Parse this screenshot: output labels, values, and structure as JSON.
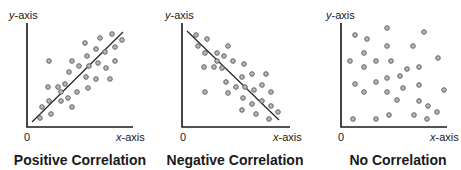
{
  "chart_data": [
    {
      "type": "scatter",
      "title": "Positive Correlation",
      "xlabel": "x-axis",
      "ylabel": "y-axis",
      "origin_label": "0",
      "grid": false,
      "trendline": {
        "present": true,
        "from": [
          5,
          6
        ],
        "to": [
          96,
          95
        ],
        "direction": "positive"
      },
      "axes_px": {
        "origin": [
          27,
          127
        ],
        "x_end": 133,
        "y_top": 22
      },
      "points_px": [
        [
          49,
          61
        ],
        [
          72,
          61
        ],
        [
          85,
          43
        ],
        [
          100,
          38
        ],
        [
          112,
          34
        ],
        [
          122,
          40
        ],
        [
          96,
          49
        ],
        [
          87,
          56
        ],
        [
          105,
          52
        ],
        [
          115,
          47
        ],
        [
          79,
          66
        ],
        [
          69,
          72
        ],
        [
          89,
          66
        ],
        [
          98,
          63
        ],
        [
          106,
          68
        ],
        [
          115,
          61
        ],
        [
          86,
          77
        ],
        [
          96,
          79
        ],
        [
          110,
          79
        ],
        [
          48,
          87
        ],
        [
          58,
          87
        ],
        [
          65,
          84
        ],
        [
          61,
          92
        ],
        [
          49,
          101
        ],
        [
          61,
          101
        ],
        [
          68,
          98
        ],
        [
          77,
          92
        ],
        [
          88,
          88
        ],
        [
          72,
          107
        ],
        [
          42,
          107
        ],
        [
          51,
          114
        ],
        [
          40,
          118
        ]
      ]
    },
    {
      "type": "scatter",
      "title": "Negative Correlation",
      "xlabel": "x-axis",
      "ylabel": "y-axis",
      "origin_label": "0",
      "grid": false,
      "trendline": {
        "present": true,
        "from": [
          5,
          95
        ],
        "to": [
          95,
          7
        ],
        "direction": "negative"
      },
      "axes_px": {
        "origin": [
          182,
          127
        ],
        "x_end": 290,
        "y_top": 22
      },
      "points_px": [
        [
          196,
          35
        ],
        [
          207,
          39
        ],
        [
          198,
          46
        ],
        [
          205,
          53
        ],
        [
          217,
          53
        ],
        [
          228,
          46
        ],
        [
          224,
          56
        ],
        [
          217,
          61
        ],
        [
          233,
          61
        ],
        [
          244,
          64
        ],
        [
          204,
          67
        ],
        [
          214,
          67
        ],
        [
          222,
          68
        ],
        [
          242,
          77
        ],
        [
          252,
          74
        ],
        [
          266,
          74
        ],
        [
          226,
          82
        ],
        [
          236,
          87
        ],
        [
          245,
          87
        ],
        [
          254,
          90
        ],
        [
          262,
          85
        ],
        [
          271,
          92
        ],
        [
          205,
          92
        ],
        [
          228,
          93
        ],
        [
          243,
          98
        ],
        [
          252,
          104
        ],
        [
          262,
          101
        ],
        [
          271,
          106
        ],
        [
          278,
          112
        ],
        [
          242,
          110
        ],
        [
          256,
          114
        ],
        [
          269,
          119
        ]
      ]
    },
    {
      "type": "scatter",
      "title": "No Correlation",
      "xlabel": "x-axis",
      "ylabel": "y-axis",
      "origin_label": "0",
      "grid": false,
      "trendline": {
        "present": false
      },
      "axes_px": {
        "origin": [
          341,
          127
        ],
        "x_end": 447,
        "y_top": 22
      },
      "points_px": [
        [
          355,
          35
        ],
        [
          387,
          28
        ],
        [
          424,
          32
        ],
        [
          367,
          39
        ],
        [
          387,
          46
        ],
        [
          413,
          46
        ],
        [
          364,
          53
        ],
        [
          350,
          61
        ],
        [
          376,
          61
        ],
        [
          391,
          61
        ],
        [
          438,
          58
        ],
        [
          364,
          67
        ],
        [
          407,
          69
        ],
        [
          419,
          67
        ],
        [
          400,
          76
        ],
        [
          387,
          78
        ],
        [
          376,
          82
        ],
        [
          355,
          84
        ],
        [
          403,
          88
        ],
        [
          419,
          85
        ],
        [
          444,
          90
        ],
        [
          364,
          92
        ],
        [
          387,
          92
        ],
        [
          397,
          100
        ],
        [
          419,
          101
        ],
        [
          428,
          106
        ],
        [
          437,
          112
        ],
        [
          353,
          119
        ],
        [
          376,
          119
        ],
        [
          389,
          115
        ],
        [
          414,
          115
        ],
        [
          427,
          119
        ]
      ]
    }
  ],
  "panels": [
    {
      "ylabel_var": "y",
      "ylabel_rest": "-axis",
      "xlabel_var": "x",
      "xlabel_rest": "-axis",
      "origin": "0",
      "title": "Positive Correlation"
    },
    {
      "ylabel_var": "y",
      "ylabel_rest": "-axis",
      "xlabel_var": "x",
      "xlabel_rest": "-axis",
      "origin": "0",
      "title": "Negative Correlation"
    },
    {
      "ylabel_var": "y",
      "ylabel_rest": "-axis",
      "xlabel_var": "x",
      "xlabel_rest": "-axis",
      "origin": "0",
      "title": "No Correlation"
    }
  ],
  "colors": {
    "axis": "#1a1a1a",
    "dot_fill": "#b8b8b8",
    "dot_stroke": "#555555",
    "trendline": "#222222"
  }
}
